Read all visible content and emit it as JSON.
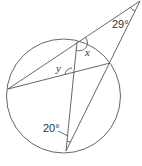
{
  "diagram": {
    "type": "circle-geometry",
    "circle": {
      "cx": 63.5,
      "cy": 96,
      "r": 57
    },
    "points": {
      "apex": [
        140,
        1
      ],
      "top": [
        77,
        42
      ],
      "right": [
        110,
        63
      ],
      "left": [
        8,
        89
      ],
      "bottom": [
        66,
        151
      ]
    },
    "labels": {
      "angle_apex": "29°",
      "angle_bottom": "20°",
      "x": "x",
      "y": "y"
    }
  }
}
